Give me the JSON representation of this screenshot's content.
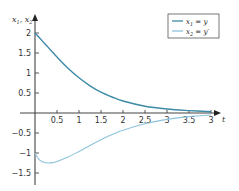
{
  "chart_data": {
    "type": "line",
    "title": "",
    "xlabel": "t",
    "ylabel": "x1, x2",
    "xlim": [
      0,
      4
    ],
    "ylim": [
      -1.75,
      2.25
    ],
    "grid": false,
    "legend_position": "upper right",
    "x_ticks": [
      0.5,
      1,
      1.5,
      2,
      2.5,
      3,
      3.5,
      4
    ],
    "x_tick_labels": [
      "0.5",
      "1",
      "1.5",
      "2",
      "2.5",
      "3",
      "3.5",
      "3"
    ],
    "y_ticks": [
      2,
      1.5,
      1,
      0.5,
      -0.5,
      -1,
      -1.5
    ],
    "y_tick_labels": [
      "2",
      "1.5",
      "1",
      "0.5",
      "−0.5",
      "−1",
      "−1.5"
    ],
    "x": [
      0,
      0.1,
      0.2,
      0.3,
      0.4,
      0.5,
      0.75,
      1,
      1.25,
      1.5,
      1.75,
      2,
      2.5,
      3,
      3.5,
      4
    ],
    "series": [
      {
        "name": "x1 = y",
        "color": "#3d8aa6",
        "values": [
          2.0,
          1.88,
          1.76,
          1.64,
          1.52,
          1.4,
          1.12,
          0.88,
          0.68,
          0.52,
          0.4,
          0.3,
          0.17,
          0.1,
          0.06,
          0.03
        ]
      },
      {
        "name": "x2 = y'",
        "color": "#8ec3dc",
        "values": [
          -1.0,
          -1.17,
          -1.23,
          -1.25,
          -1.24,
          -1.21,
          -1.1,
          -0.96,
          -0.81,
          -0.67,
          -0.54,
          -0.43,
          -0.27,
          -0.16,
          -0.09,
          -0.05
        ]
      }
    ]
  },
  "legend": {
    "items": [
      {
        "label_main": "x",
        "label_sub": "1",
        "label_rest": " = y"
      },
      {
        "label_main": "x",
        "label_sub": "2",
        "label_rest": " = y′"
      }
    ]
  },
  "axis": {
    "x_label": "t",
    "y_label_main1": "x",
    "y_label_sub1": "1",
    "y_label_sep": ", ",
    "y_label_main2": "x",
    "y_label_sub2": "2"
  }
}
